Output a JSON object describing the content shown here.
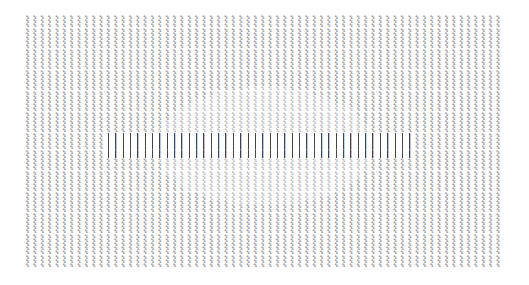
{
  "image": {
    "kind": "ascii-art",
    "glyph": "%",
    "columns": 65,
    "column_pitch_px": 7.35,
    "art_bounds": {
      "x": 25,
      "y": 15,
      "width": 478,
      "height": 255
    },
    "rows_per_column": 60,
    "colors": {
      "background": "#ffffff",
      "ink": "#3a3a3a",
      "light_ink": "#777777",
      "band_line": "#444444"
    },
    "regions": {
      "light_oval": {
        "cx": 265,
        "cy": 148,
        "rx": 110,
        "ry": 60
      },
      "bright_band": {
        "x": 105,
        "y": 135,
        "width": 310,
        "height": 25
      }
    }
  }
}
